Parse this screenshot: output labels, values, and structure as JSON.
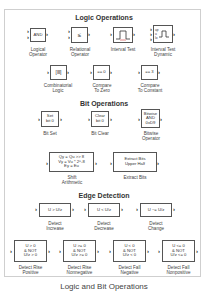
{
  "sections": {
    "logic": "Logic Operations",
    "bit": "Bit Operations",
    "edge": "Edge Detection"
  },
  "blocks": {
    "logical_operator": {
      "icon_text": "AND",
      "label1": "Logical",
      "label2": "Operator"
    },
    "relational_operator": {
      "icon_text": "≤",
      "label1": "Relational",
      "label2": "Operator"
    },
    "interval_test": {
      "label1": "Interval Test"
    },
    "interval_test_dynamic": {
      "port_up": "up",
      "port_u": "u",
      "port_lo": "lo",
      "label1": "Interval Test",
      "label2": "Dynamic"
    },
    "combinatorial_logic": {
      "icon_text": "[ⅠⅠⅠ]",
      "label1": "Combinatorial",
      "label2": "Logic"
    },
    "compare_to_zero": {
      "icon_text": "== 0",
      "label1": "Compare",
      "label2": "To Zero"
    },
    "compare_to_constant": {
      "icon_text": "== 3",
      "label1": "Compare",
      "label2": "To Constant"
    },
    "bit_set": {
      "icon_line1": "Set",
      "icon_line2": "bit 0",
      "label1": "Bit Set"
    },
    "bit_clear": {
      "icon_line1": "Clear",
      "icon_line2": "bit 0",
      "label1": "Bit Clear"
    },
    "bitwise_operator": {
      "icon_line1": "Bitwise",
      "icon_line2": "AND",
      "icon_line3": "0xD9",
      "label1": "Bitwise",
      "label2": "Operator"
    },
    "shift_arithmetic": {
      "icon_line1": "Qy = Qu >> 8",
      "icon_line2": "Vy = Vu * 2^-8",
      "icon_line3": "Ey = Eu",
      "label1": "Shift",
      "label2": "Arithmetic"
    },
    "extract_bits": {
      "icon_line1": "Extract Bits",
      "icon_line2": "Upper Half",
      "label1": "Extract Bits"
    },
    "detect_increase": {
      "icon_text": "U > U/z",
      "label1": "Detect",
      "label2": "Increase"
    },
    "detect_decrease": {
      "icon_text": "U < U/z",
      "label1": "Detect",
      "label2": "Decrease"
    },
    "detect_change": {
      "icon_text": "U ~= U/z",
      "label1": "Detect",
      "label2": "Change"
    },
    "detect_rise_positive": {
      "icon_line1": "U > 0",
      "icon_line2": "& NOT",
      "icon_line3": "U/z > 0",
      "label1": "Detect Rise",
      "label2": "Positive"
    },
    "detect_rise_nonnegative": {
      "icon_line1": "U >= 0",
      "icon_line2": "& NOT",
      "icon_line3": "U/z >= 0",
      "label1": "Detect Rise",
      "label2": "Nonnegative"
    },
    "detect_fall_negative": {
      "icon_line1": "U < 0",
      "icon_line2": "& NOT",
      "icon_line3": "U/z < 0",
      "label1": "Detect Fall",
      "label2": "Negative"
    },
    "detect_fall_nonpositive": {
      "icon_line1": "U <= 0",
      "icon_line2": "& NOT",
      "icon_line3": "U/z <= 0",
      "label1": "Detect Fall",
      "label2": "Nonpositive"
    }
  },
  "port_glyph": "›",
  "caption": "Logic and Bit Operations"
}
